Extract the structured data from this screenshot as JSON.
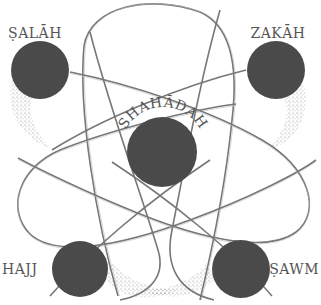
{
  "diagram": {
    "type": "atom-model",
    "colors": {
      "circle_fill": "#4a4a4a",
      "orbit_stroke": "#777777",
      "label_color": "#555555",
      "background": "#ffffff"
    },
    "center": {
      "label": "SHAHĀDAH"
    },
    "pillars": [
      {
        "id": "salah",
        "label": "ṢALĀH",
        "position": "top-left"
      },
      {
        "id": "zakah",
        "label": "ZAKĀH",
        "position": "top-right"
      },
      {
        "id": "hajj",
        "label": "HAJJ",
        "position": "bottom-left"
      },
      {
        "id": "sawm",
        "label": "ṢAWM",
        "position": "bottom-right"
      }
    ]
  }
}
